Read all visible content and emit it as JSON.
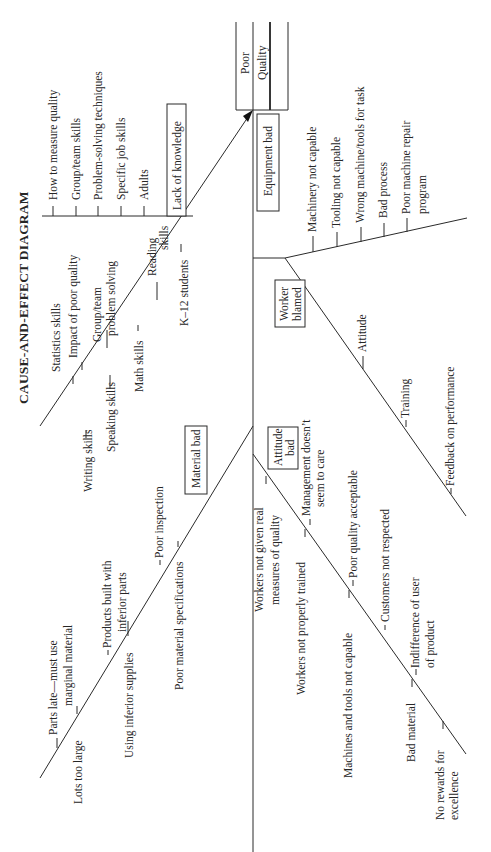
{
  "title": "CAUSE-AND-EFFECT DIAGRAM",
  "effect": {
    "line1": "Poor",
    "line2": "Quality"
  },
  "categories": {
    "lack_of_knowledge": {
      "label": "Lack of knowledge",
      "adults_branch": [
        "How to measure quality",
        "Group/team skills",
        "Problem-solving techniques",
        "Specific job skills",
        "Adults"
      ],
      "k12_branch": {
        "label": "K–12 students",
        "causes_above": [
          "Statistics skills",
          "Impact of poor quality",
          "Group/team problem solving",
          "Reading skills"
        ],
        "causes_below": [
          "Writing skills",
          "Speaking skills",
          "Math skills"
        ],
        "multiline": {
          "group_team_1": "Group/team",
          "group_team_2": "problem solving",
          "reading_1": "Reading",
          "reading_2": "skills"
        }
      }
    },
    "material_bad": {
      "label": "Material bad",
      "causes_above": [
        "Parts late—must use marginal material",
        "Products built with inferior parts",
        "Poor inspection"
      ],
      "causes_below": [
        "Lots too large",
        "Using inferior supplies",
        "Poor material specifications"
      ],
      "multiline": {
        "parts_late_1": "Parts late—must use",
        "parts_late_2": "marginal material",
        "products_1": "Products built with",
        "products_2": "inferior parts"
      }
    },
    "equipment_bad": {
      "label": "Equipment bad",
      "causes": [
        "Machinery not capable",
        "Tooling not capable",
        "Wrong machine/tools for task",
        "Bad process",
        "Poor machine repair program"
      ],
      "multiline": {
        "repair_1": "Poor machine repair",
        "repair_2": "program"
      }
    },
    "worker_blamed": {
      "label_1": "Worker",
      "label_2": "blamed",
      "causes": [
        "Attitude",
        "Training",
        "Feedback on performance"
      ]
    },
    "attitude_bad": {
      "label_1": "Attitude",
      "label_2": "bad",
      "causes_left": [
        "Workers not given real measures of quality",
        "Workers not properly trained",
        "Machines and tools not capable",
        "Bad material",
        "No rewards for excellence"
      ],
      "causes_right": [
        "Management doesn’t seem to care",
        "Poor quality acceptable",
        "Customers not respected",
        "Indifference of user of product"
      ],
      "multiline": {
        "measures_1": "Workers not given real",
        "measures_2": "measures of quality",
        "mgmt_1": "Management doesn’t",
        "mgmt_2": "seem to care",
        "indiff_1": "Indifference of user",
        "indiff_2": "of product",
        "rewards_1": "No rewards for",
        "rewards_2": "excellence"
      }
    }
  }
}
